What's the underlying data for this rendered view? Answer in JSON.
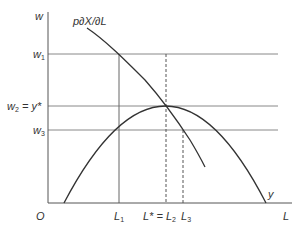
{
  "diagram": {
    "axes": {
      "y_label": "w",
      "x_label": "L",
      "origin_label": "O"
    },
    "curves": {
      "mrp_label": "p∂X/∂L",
      "parabola_label": "y"
    },
    "y_ticks": {
      "w1": {
        "base": "w",
        "sub": "1"
      },
      "w2": {
        "base": "w",
        "sub": "2",
        "suffix": " = y*"
      },
      "w3": {
        "base": "w",
        "sub": "3"
      }
    },
    "x_ticks": {
      "l1": {
        "base": "L",
        "sub": "1"
      },
      "lstar": {
        "prefix": "L* = L",
        "sub": "2"
      },
      "l3": {
        "base": "L",
        "sub": "3"
      }
    },
    "colors": {
      "curve": "#333333",
      "grid": "#888888"
    }
  }
}
